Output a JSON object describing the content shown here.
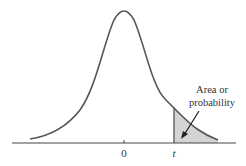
{
  "figure": {
    "type": "t-distribution right-tail area diagram",
    "annotation": {
      "line1": "Area or",
      "line2": "probability"
    },
    "axis": {
      "center_label": "0",
      "cutoff_label": "t"
    },
    "colors": {
      "curve": "#555555",
      "shade": "#d4d4d4",
      "axis": "#444444",
      "text": "#333333"
    }
  }
}
